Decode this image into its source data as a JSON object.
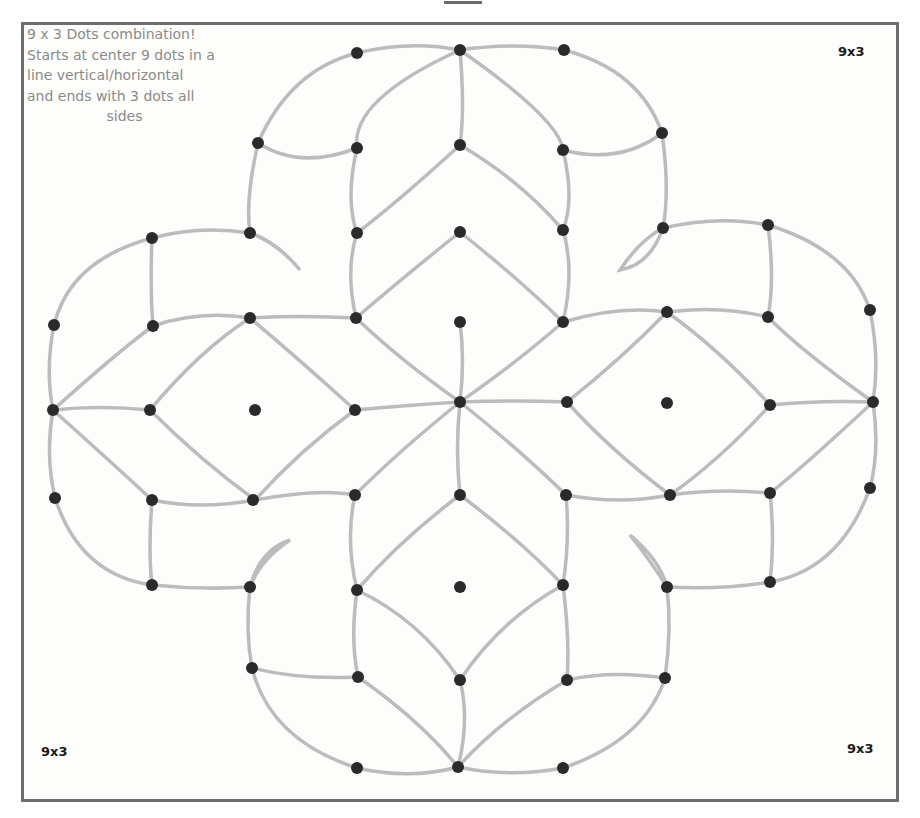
{
  "description": {
    "lines": [
      "9 x 3 Dots combination!",
      "Starts at center 9 dots in a",
      "line vertical/horizontal",
      "and ends with 3 dots all",
      "sides"
    ]
  },
  "corner_labels": {
    "top_right": "9x3",
    "bottom_left": "9x3",
    "bottom_right": "9x3"
  },
  "colors": {
    "frame_border": "#6d6d6d",
    "dot": "#2a2a2a",
    "line": "#b8b8b8",
    "description_text": "#8a8a8a",
    "label_text": "#1a1a1a"
  },
  "pattern": {
    "type": "kolam rangoli dot pattern",
    "dot_grid": "9 x 3 cross",
    "dots": [
      [
        357,
        53
      ],
      [
        460,
        50
      ],
      [
        564,
        50
      ],
      [
        258,
        143
      ],
      [
        357,
        148
      ],
      [
        460,
        145
      ],
      [
        563,
        150
      ],
      [
        662,
        133
      ],
      [
        152,
        238
      ],
      [
        250,
        233
      ],
      [
        357,
        233
      ],
      [
        460,
        232
      ],
      [
        563,
        230
      ],
      [
        663,
        228
      ],
      [
        768,
        225
      ],
      [
        54,
        325
      ],
      [
        153,
        326
      ],
      [
        250,
        318
      ],
      [
        356,
        318
      ],
      [
        460,
        322
      ],
      [
        563,
        322
      ],
      [
        667,
        312
      ],
      [
        768,
        317
      ],
      [
        870,
        310
      ],
      [
        53,
        410
      ],
      [
        150,
        410
      ],
      [
        255,
        410
      ],
      [
        355,
        410
      ],
      [
        460,
        402
      ],
      [
        567,
        402
      ],
      [
        667,
        403
      ],
      [
        770,
        405
      ],
      [
        873,
        402
      ],
      [
        55,
        498
      ],
      [
        152,
        500
      ],
      [
        253,
        500
      ],
      [
        355,
        495
      ],
      [
        460,
        495
      ],
      [
        566,
        495
      ],
      [
        670,
        495
      ],
      [
        770,
        493
      ],
      [
        870,
        488
      ],
      [
        152,
        585
      ],
      [
        250,
        587
      ],
      [
        357,
        590
      ],
      [
        460,
        587
      ],
      [
        563,
        585
      ],
      [
        667,
        587
      ],
      [
        770,
        582
      ],
      [
        252,
        668
      ],
      [
        358,
        677
      ],
      [
        460,
        680
      ],
      [
        567,
        680
      ],
      [
        665,
        678
      ],
      [
        357,
        768
      ],
      [
        458,
        767
      ],
      [
        563,
        768
      ]
    ]
  }
}
